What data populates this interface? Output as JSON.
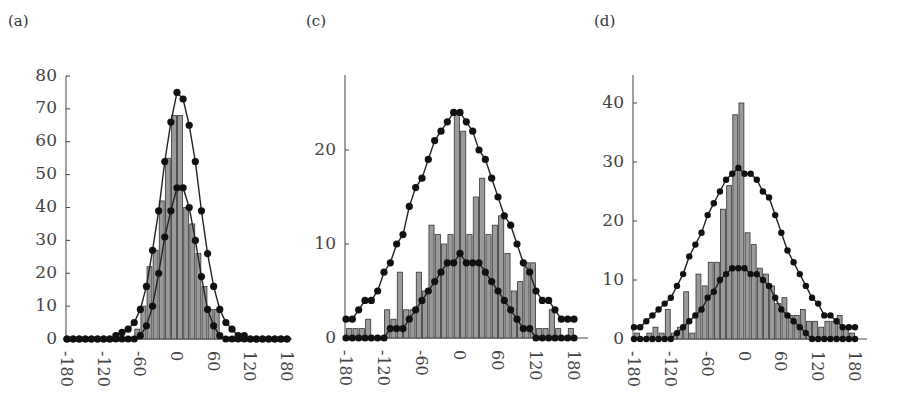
{
  "panels": [
    {
      "id": "a",
      "label": "(a)"
    },
    {
      "id": "c",
      "label": "(c)"
    },
    {
      "id": "d",
      "label": "(d)"
    }
  ],
  "chart_data": [
    {
      "panel": "(a)",
      "type": "bar",
      "title": "",
      "xlabel": "",
      "ylabel": "",
      "xlim": [
        -180,
        180
      ],
      "ylim": [
        0,
        80
      ],
      "xticks": [
        -180,
        -120,
        -60,
        0,
        60,
        120,
        180
      ],
      "yticks": [
        0,
        10,
        20,
        30,
        40,
        50,
        60,
        70,
        80
      ],
      "grid": false,
      "legend": null,
      "bin_width": 10,
      "bar_centers": [
        -175,
        -165,
        -155,
        -145,
        -135,
        -125,
        -115,
        -105,
        -95,
        -85,
        -75,
        -65,
        -55,
        -45,
        -35,
        -25,
        -15,
        -5,
        5,
        15,
        25,
        35,
        45,
        55,
        65,
        75,
        85,
        95,
        105,
        115,
        125,
        135,
        145,
        155,
        165,
        175
      ],
      "bars": [
        0,
        0,
        0,
        0,
        0,
        0,
        0,
        0,
        0,
        0,
        0,
        3,
        10,
        22,
        27,
        42,
        55,
        68,
        68,
        40,
        35,
        26,
        16,
        9,
        9,
        0,
        0,
        0,
        0,
        0,
        0,
        0,
        0,
        0,
        0,
        0
      ],
      "curve_x": [
        -180,
        -170,
        -160,
        -150,
        -140,
        -130,
        -120,
        -110,
        -100,
        -90,
        -80,
        -70,
        -60,
        -50,
        -40,
        -30,
        -20,
        -10,
        0,
        10,
        20,
        30,
        40,
        50,
        60,
        70,
        80,
        90,
        100,
        110,
        120,
        130,
        140,
        150,
        160,
        170,
        180
      ],
      "series": [
        {
          "name": "outer curve",
          "type": "line",
          "values": [
            0,
            0,
            0,
            0,
            0,
            0,
            0,
            0,
            1,
            2,
            3,
            5,
            9,
            16,
            27,
            39,
            54,
            66,
            75,
            73,
            65,
            54,
            39,
            26,
            16,
            9,
            5,
            3,
            1,
            1,
            0,
            0,
            0,
            0,
            0,
            0,
            0
          ]
        },
        {
          "name": "inner curve",
          "type": "line",
          "values": [
            0,
            0,
            0,
            0,
            0,
            0,
            0,
            0,
            0,
            0,
            0,
            0,
            1,
            4,
            10,
            20,
            31,
            39,
            46,
            46,
            40,
            30,
            19,
            9,
            4,
            1,
            0,
            0,
            0,
            0,
            0,
            0,
            0,
            0,
            0,
            0,
            0
          ]
        }
      ]
    },
    {
      "panel": "(c)",
      "type": "bar",
      "title": "",
      "xlabel": "",
      "ylabel": "",
      "xlim": [
        -180,
        180
      ],
      "ylim": [
        0,
        26
      ],
      "xticks": [
        -180,
        -120,
        -60,
        0,
        60,
        120,
        180
      ],
      "yticks": [
        0,
        10,
        20
      ],
      "grid": false,
      "legend": null,
      "bin_width": 10,
      "bar_centers": [
        -175,
        -165,
        -155,
        -145,
        -135,
        -125,
        -115,
        -105,
        -95,
        -85,
        -75,
        -65,
        -55,
        -45,
        -35,
        -25,
        -15,
        -5,
        5,
        15,
        25,
        35,
        45,
        55,
        65,
        75,
        85,
        95,
        105,
        115,
        125,
        135,
        145,
        155,
        165,
        175
      ],
      "bars": [
        1,
        1,
        1,
        2,
        0,
        0,
        3,
        2,
        7,
        3,
        3,
        7,
        5,
        12,
        11,
        10,
        11,
        24,
        22,
        11,
        15,
        17,
        11,
        12,
        13,
        9,
        5,
        6,
        8,
        8,
        1,
        1,
        3,
        1,
        0,
        1
      ],
      "curve_x": [
        -180,
        -170,
        -160,
        -150,
        -140,
        -130,
        -120,
        -110,
        -100,
        -90,
        -80,
        -70,
        -60,
        -50,
        -40,
        -30,
        -20,
        -10,
        0,
        10,
        20,
        30,
        40,
        50,
        60,
        70,
        80,
        90,
        100,
        110,
        120,
        130,
        140,
        150,
        160,
        170,
        180
      ],
      "series": [
        {
          "name": "outer curve",
          "type": "line",
          "values": [
            2,
            2,
            3,
            4,
            4,
            5,
            7,
            8,
            10,
            11,
            14,
            16,
            17,
            19,
            21,
            22,
            23,
            24,
            24,
            23,
            22,
            20,
            19,
            17,
            15,
            13,
            12,
            10,
            8,
            7,
            5,
            4,
            4,
            3,
            2,
            2,
            2
          ]
        },
        {
          "name": "inner curve",
          "type": "line",
          "values": [
            0,
            0,
            0,
            0,
            0,
            0,
            0,
            1,
            1,
            1,
            2,
            3,
            4,
            5,
            6,
            7,
            8,
            8,
            9,
            8,
            8,
            8,
            7,
            6,
            5,
            4,
            3,
            2,
            1,
            1,
            0,
            0,
            0,
            0,
            0,
            0,
            0
          ]
        }
      ]
    },
    {
      "panel": "(d)",
      "type": "bar",
      "title": "",
      "xlabel": "",
      "ylabel": "",
      "xlim": [
        -180,
        180
      ],
      "ylim": [
        0,
        45
      ],
      "xticks": [
        -180,
        -120,
        -60,
        0,
        60,
        120,
        180
      ],
      "yticks": [
        0,
        10,
        20,
        30,
        40
      ],
      "grid": false,
      "legend": null,
      "bin_width": 10,
      "bar_centers": [
        -175,
        -165,
        -155,
        -145,
        -135,
        -125,
        -115,
        -105,
        -95,
        -85,
        -75,
        -65,
        -55,
        -45,
        -35,
        -25,
        -15,
        -5,
        5,
        15,
        25,
        35,
        45,
        55,
        65,
        75,
        85,
        95,
        105,
        115,
        125,
        135,
        145,
        155,
        165,
        175
      ],
      "bars": [
        1,
        0,
        1,
        2,
        1,
        5,
        1,
        2,
        8,
        1,
        11,
        9,
        13,
        13,
        22,
        26,
        38,
        40,
        18,
        16,
        12,
        11,
        9,
        6,
        7,
        4,
        4,
        5,
        3,
        3,
        2,
        3,
        3,
        4,
        2,
        1
      ],
      "curve_x": [
        -180,
        -170,
        -160,
        -150,
        -140,
        -130,
        -120,
        -110,
        -100,
        -90,
        -80,
        -70,
        -60,
        -50,
        -40,
        -30,
        -20,
        -10,
        0,
        10,
        20,
        30,
        40,
        50,
        60,
        70,
        80,
        90,
        100,
        110,
        120,
        130,
        140,
        150,
        160,
        170,
        180
      ],
      "series": [
        {
          "name": "outer curve",
          "type": "line",
          "values": [
            2,
            2,
            3,
            4,
            5,
            6,
            7,
            9,
            11,
            14,
            16,
            18,
            21,
            23,
            25,
            27,
            28,
            29,
            28,
            28,
            27,
            25,
            24,
            21,
            18,
            15,
            13,
            11,
            9,
            7,
            6,
            4,
            4,
            3,
            2,
            2,
            2
          ]
        },
        {
          "name": "inner curve",
          "type": "line",
          "values": [
            0,
            0,
            0,
            0,
            0,
            0,
            0,
            1,
            2,
            3,
            4,
            5,
            7,
            8,
            10,
            11,
            12,
            12,
            12,
            11,
            11,
            10,
            9,
            7,
            5,
            4,
            3,
            2,
            1,
            0,
            0,
            0,
            0,
            0,
            0,
            0,
            0
          ]
        }
      ]
    }
  ]
}
